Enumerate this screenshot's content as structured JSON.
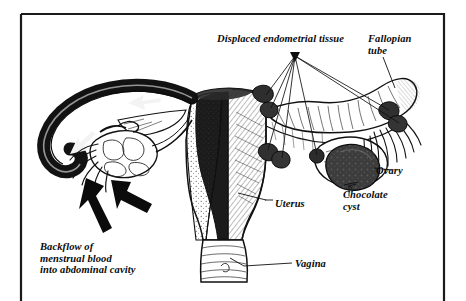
{
  "figure": {
    "background_color": "#ffffff",
    "ink_color": "#111111",
    "frame": {
      "name": "illustration-border",
      "color": "#1a1a1a",
      "stroke_width": 2
    }
  },
  "labels": {
    "displaced_tissue": "Displaced endometrial tissue",
    "fallopian_tube": "Fallopian\ntube",
    "ovary": "Ovary",
    "chocolate_cyst": "Chocolate\ncyst",
    "uterus": "Uterus",
    "vagina": "Vagina",
    "backflow": "Backflow of\nmenstrual blood\ninto abdominal cavity"
  },
  "anatomy": {
    "parts": [
      {
        "id": "uterus",
        "label": "Uterus",
        "description": "Central uterine body shown in cross-section, left half cut away revealing endometrium"
      },
      {
        "id": "left-fallopian-tube",
        "label": "Fallopian tube (left)",
        "description": "Darkened tube containing backflow arrows"
      },
      {
        "id": "right-fallopian-tube",
        "label": "Fallopian tube (right)",
        "description": "Intact tube with endometrial implants"
      },
      {
        "id": "left-ovary",
        "label": "Ovary (left)",
        "description": "Pale lobulated ovary with fimbriae"
      },
      {
        "id": "right-ovary",
        "label": "Ovary (right)",
        "description": "Ovary bearing dark chocolate cyst"
      },
      {
        "id": "chocolate-cyst",
        "label": "Chocolate cyst",
        "description": "Dark endometrioma mass on right ovary"
      },
      {
        "id": "vagina",
        "label": "Vagina",
        "description": "Lower canal below cervix"
      },
      {
        "id": "endometrial-implants",
        "label": "Displaced endometrial tissue",
        "description": "Six dark nodules on tubes, uterus and ovary"
      }
    ],
    "implant_count": 6,
    "arrows": {
      "tube_flow_count": 2,
      "abdominal_spill_count": 2,
      "direction": "retrograde, out of fimbriated end into abdominal cavity"
    }
  }
}
